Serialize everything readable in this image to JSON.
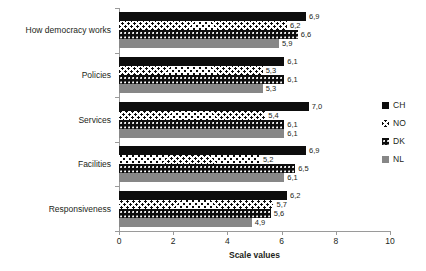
{
  "chart_data": {
    "type": "bar",
    "orientation": "horizontal",
    "title": "",
    "xlabel": "Scale values",
    "ylabel": "",
    "xlim": [
      0,
      10
    ],
    "xticks": [
      "0",
      "2",
      "4",
      "6",
      "8",
      "10"
    ],
    "grid": false,
    "legend_position": "right",
    "decimal_separator": ",",
    "categories": [
      "How democracy works",
      "Policies",
      "Services",
      "Facilities",
      "Responsiveness"
    ],
    "series": [
      {
        "name": "CH",
        "color": "#0d0d0d",
        "pattern": "solid-black",
        "values": [
          6.9,
          6.1,
          7.0,
          6.9,
          6.2
        ],
        "labels": [
          "6,9",
          "6,1",
          "7,0",
          "6,9",
          "6,2"
        ]
      },
      {
        "name": "NO",
        "color": "#ffffff",
        "pattern": "checkered",
        "values": [
          6.2,
          5.3,
          5.4,
          5.2,
          5.7
        ],
        "labels": [
          "6,2",
          "5,3",
          "5,4",
          "5,2",
          "5,7"
        ]
      },
      {
        "name": "DK",
        "color": "#0d0d0d",
        "pattern": "black-dotted",
        "values": [
          6.6,
          6.1,
          6.1,
          6.5,
          5.6
        ],
        "labels": [
          "6,6",
          "6,1",
          "6,1",
          "6,5",
          "5,6"
        ]
      },
      {
        "name": "NL",
        "color": "#878787",
        "pattern": "solid-gray",
        "values": [
          5.9,
          5.3,
          6.1,
          6.1,
          4.9
        ],
        "labels": [
          "5,9",
          "5,3",
          "6,1",
          "6,1",
          "4,9"
        ]
      }
    ]
  }
}
